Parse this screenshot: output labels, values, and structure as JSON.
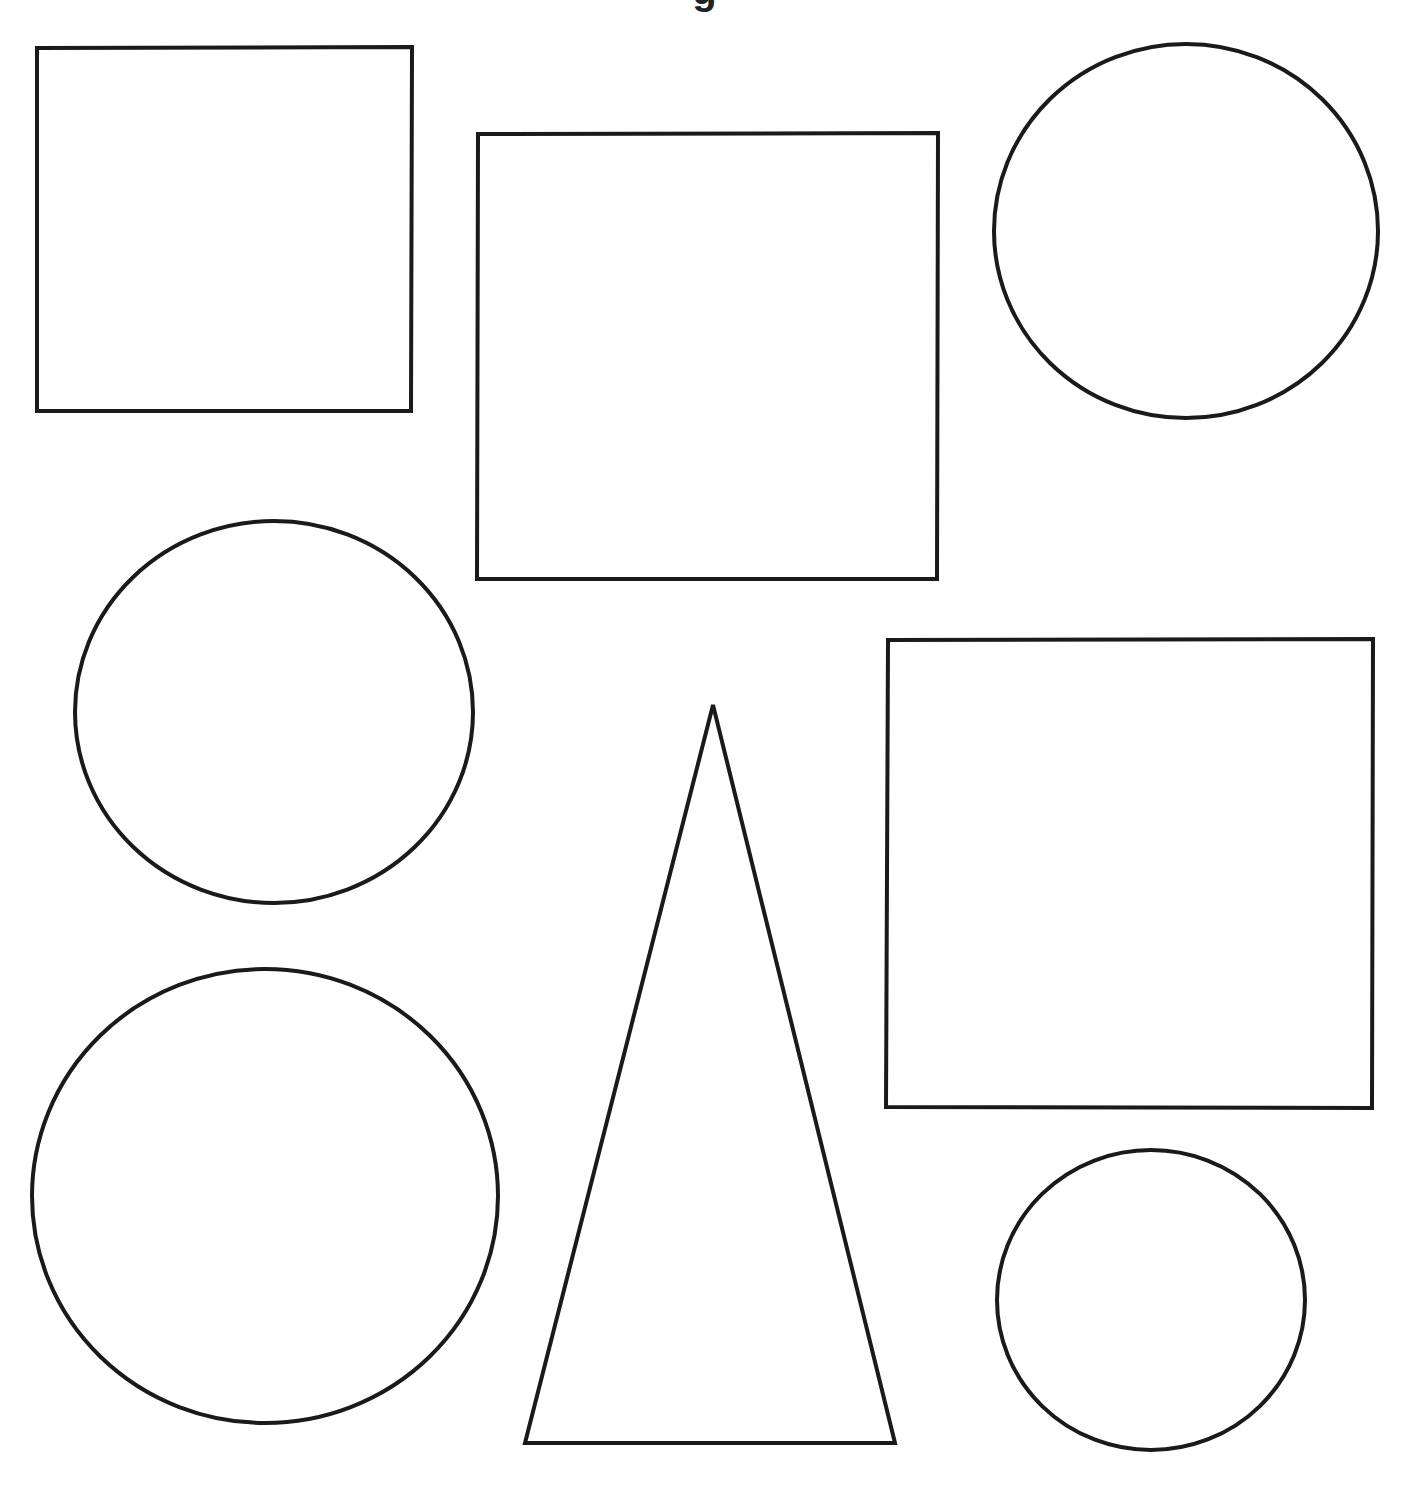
{
  "page": {
    "background": "#ffffff",
    "stroke_color": "#1a1a1a",
    "stroke_width": 4,
    "title_fragment": "g"
  },
  "shapes": [
    {
      "type": "rect",
      "name": "square-top-left",
      "points": "37,48 412,47 411,411 37,411"
    },
    {
      "type": "rect",
      "name": "square-top-middle",
      "points": "478,134 938,133 937,579 477,579"
    },
    {
      "type": "ellipse",
      "name": "circle-top-right",
      "cx": 1186,
      "cy": 231,
      "rx": 192,
      "ry": 187
    },
    {
      "type": "ellipse",
      "name": "circle-middle-left",
      "cx": 274,
      "cy": 712,
      "rx": 199,
      "ry": 191
    },
    {
      "type": "triangle",
      "name": "triangle-center",
      "points": "713,705 895,1443 525,1443"
    },
    {
      "type": "rect",
      "name": "square-right",
      "points": "888,640 1373,639 1372,1108 886,1107"
    },
    {
      "type": "ellipse",
      "name": "circle-bottom-left",
      "cx": 265,
      "cy": 1196,
      "rx": 233,
      "ry": 227
    },
    {
      "type": "ellipse",
      "name": "circle-bottom-right",
      "cx": 1151,
      "cy": 1300,
      "rx": 154,
      "ry": 150
    }
  ]
}
